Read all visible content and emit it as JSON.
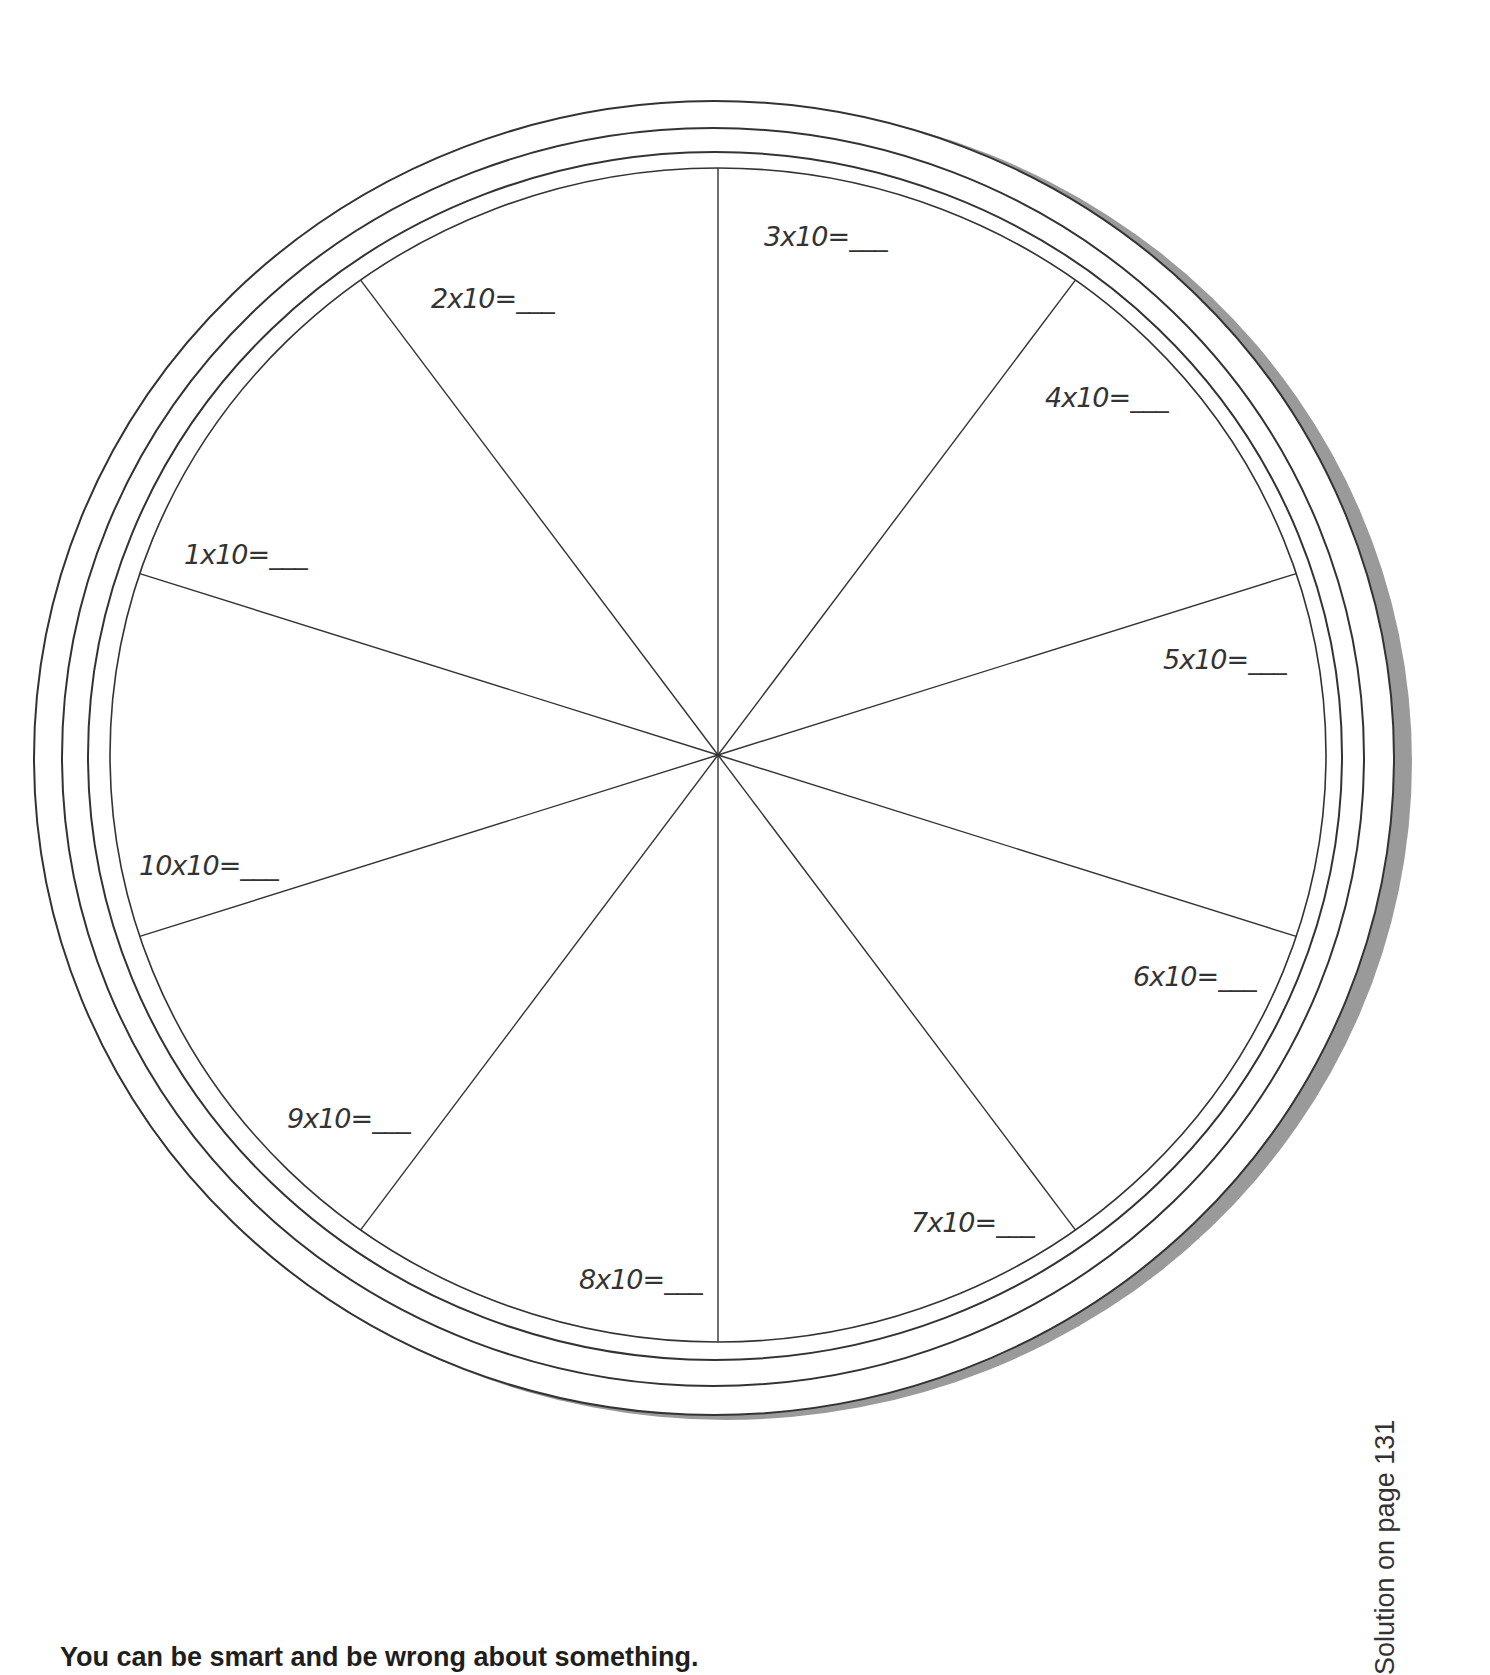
{
  "worksheet": {
    "type": "multiplication wheel",
    "center_factor": "x10",
    "segments": [
      {
        "label": "1x10=___",
        "x": 184,
        "y": 554
      },
      {
        "label": "2x10=___",
        "x": 431,
        "y": 298
      },
      {
        "label": "3x10=___",
        "x": 764,
        "y": 236
      },
      {
        "label": "4x10=___",
        "x": 1045,
        "y": 397
      },
      {
        "label": "5x10=___",
        "x": 1163,
        "y": 659
      },
      {
        "label": "6x10=___",
        "x": 1133,
        "y": 976
      },
      {
        "label": "7x10=___",
        "x": 911,
        "y": 1222
      },
      {
        "label": "8x10=___",
        "x": 579,
        "y": 1279
      },
      {
        "label": "9x10=___",
        "x": 287,
        "y": 1118
      },
      {
        "label": "10x10=___",
        "x": 139,
        "y": 865
      }
    ]
  },
  "footer": {
    "quote": "You can be smart and be wrong about something.",
    "solution_note": "Solution on page 131"
  },
  "colors": {
    "line": "#333333",
    "shadow": "#9a9a9a",
    "text": "#1e1e1e"
  }
}
